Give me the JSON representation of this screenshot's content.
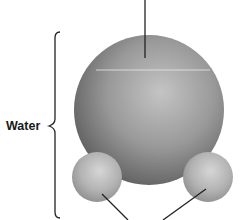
{
  "diagram": {
    "type": "molecule-model",
    "molecule_label": "Water",
    "bracket": {
      "x": 55,
      "top_y": 32,
      "bottom_y": 218,
      "point_x": 48,
      "point_y": 126,
      "stroke": "#222222"
    },
    "atoms": [
      {
        "role": "oxygen",
        "cx": 149,
        "cy": 110,
        "r": 75,
        "highlight_color": "#c4c4c4",
        "shadow_color": "#5e5e5e"
      },
      {
        "role": "hydrogen-left",
        "cx": 97,
        "cy": 177,
        "r": 25,
        "highlight_color": "#d6d6d6",
        "shadow_color": "#8c8c8c"
      },
      {
        "role": "hydrogen-right",
        "cx": 208,
        "cy": 177,
        "r": 25,
        "highlight_color": "#d6d6d6",
        "shadow_color": "#8c8c8c"
      }
    ],
    "leader_lines": [
      {
        "target": "oxygen",
        "x1": 145,
        "y1": 0,
        "x2": 145,
        "y2": 58
      },
      {
        "target": "hydrogen-left",
        "x1": 102,
        "y1": 194,
        "x2": 128,
        "y2": 220
      },
      {
        "target": "hydrogen-right",
        "x1": 206,
        "y1": 189,
        "x2": 163,
        "y2": 220
      }
    ],
    "colors": {
      "line": "#222222",
      "background": "#ffffff",
      "seam": "#e8e8e8"
    }
  }
}
